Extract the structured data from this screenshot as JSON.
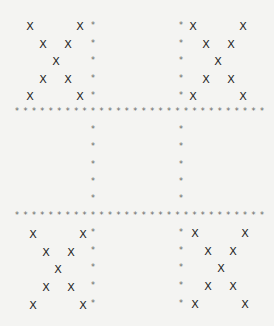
{
  "board": {
    "mark_x": "X",
    "mark_star": "*",
    "colors": {
      "background": "#f4f4f2",
      "x": "#222222",
      "star": "#666666"
    },
    "rule_rows_y": [
      112,
      216
    ],
    "rule_x_start": 17,
    "rule_x_end": 262,
    "rule_count": 30,
    "vertical_cols_x": [
      93,
      181
    ],
    "cells": [
      {
        "name": "top-left",
        "value": "X",
        "rows": [
          [
            30,
            26
          ],
          [
            80,
            26
          ],
          [
            43,
            44
          ],
          [
            68,
            44
          ],
          [
            56,
            61
          ],
          [
            43,
            79
          ],
          [
            68,
            79
          ],
          [
            30,
            96
          ],
          [
            80,
            96
          ]
        ]
      },
      {
        "name": "top-right",
        "value": "X",
        "rows": [
          [
            193,
            26
          ],
          [
            243,
            26
          ],
          [
            206,
            44
          ],
          [
            231,
            44
          ],
          [
            218,
            61
          ],
          [
            206,
            79
          ],
          [
            231,
            79
          ],
          [
            193,
            96
          ],
          [
            243,
            96
          ]
        ]
      },
      {
        "name": "middle-left",
        "value": ""
      },
      {
        "name": "middle-center",
        "value": ""
      },
      {
        "name": "middle-right",
        "value": ""
      },
      {
        "name": "bottom-left",
        "value": "X",
        "rows": [
          [
            33,
            234
          ],
          [
            83,
            234
          ],
          [
            46,
            252
          ],
          [
            71,
            252
          ],
          [
            58,
            269
          ],
          [
            46,
            287
          ],
          [
            71,
            287
          ],
          [
            33,
            305
          ],
          [
            83,
            305
          ]
        ]
      },
      {
        "name": "bottom-right",
        "value": "X",
        "rows": [
          [
            195,
            233
          ],
          [
            245,
            233
          ],
          [
            208,
            251
          ],
          [
            233,
            251
          ],
          [
            221,
            268
          ],
          [
            208,
            286
          ],
          [
            233,
            286
          ],
          [
            195,
            304
          ],
          [
            245,
            304
          ]
        ]
      }
    ]
  }
}
